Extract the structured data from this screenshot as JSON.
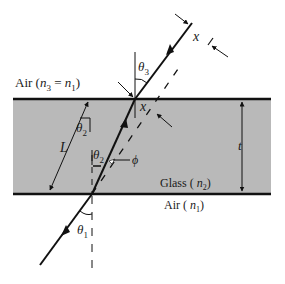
{
  "diagram": {
    "colors": {
      "glass_fill": "#b9b9b9",
      "line": "#111111",
      "background": "#ffffff"
    },
    "regions": {
      "top_medium": {
        "label_prefix": "Air (",
        "symbol_a": "n",
        "sub_a": "3",
        "eq": " = ",
        "symbol_b": "n",
        "sub_b": "1",
        "suffix": ")"
      },
      "slab": {
        "label_prefix": "Glass ( ",
        "symbol": "n",
        "sub": "2",
        "suffix": ")"
      },
      "bottom_medium": {
        "label_prefix": "Air ( ",
        "symbol": "n",
        "sub": "1",
        "suffix": ")"
      }
    },
    "angles": {
      "theta1": {
        "symbol": "θ",
        "sub": "1"
      },
      "theta2_upper": {
        "symbol": "θ",
        "sub": "2"
      },
      "theta2_lower": {
        "symbol": "θ",
        "sub": "2"
      },
      "theta3": {
        "symbol": "θ",
        "sub": "3"
      },
      "phi": {
        "symbol": "ϕ"
      }
    },
    "dimensions": {
      "L": "L",
      "t": "t",
      "x_inside": "x",
      "x_outside": "x"
    }
  }
}
